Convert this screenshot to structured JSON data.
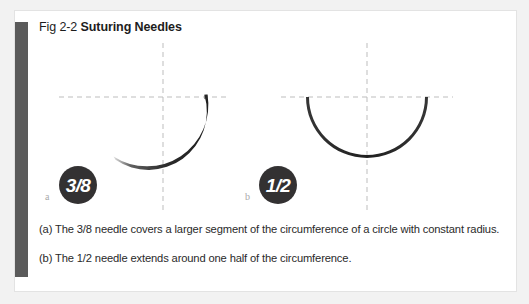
{
  "figure": {
    "number": "Fig 2-2",
    "name": "Suturing Needles",
    "panel_background": "#ffffff",
    "page_background": "#f2f2f2",
    "accent_bar_color": "#5b5b5b",
    "border_color": "#e3e3e3"
  },
  "illustration": {
    "guide_color": "#bdbdbd",
    "needle_color": "#2b2b2b",
    "panels": [
      {
        "id": "needle-a",
        "badge_label": "3/8",
        "sublabel": "a",
        "arc_fraction": "3/8",
        "center_x": 148,
        "center_y": 87,
        "radius": 60,
        "horizontal_guide_y": 86,
        "vertical_guide_x": 148
      },
      {
        "id": "needle-b",
        "badge_label": "1/2",
        "sublabel": "b",
        "arc_fraction": "1/2",
        "center_x": 352,
        "center_y": 87,
        "radius": 60,
        "horizontal_guide_y": 86,
        "vertical_guide_x": 352
      }
    ],
    "badge_color": "#333132",
    "badge_text_color": "#ffffff"
  },
  "captions": [
    "(a) The 3/8 needle covers a larger segment of the circumference of a circle with constant radius.",
    "(b) The 1/2 needle extends around one half of the circumference."
  ]
}
